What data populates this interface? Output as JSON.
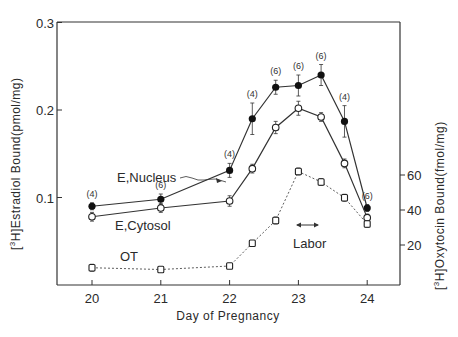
{
  "chart_data": {
    "type": "line",
    "title": "",
    "xlabel": "Day of Pregnancy",
    "ylabel": "[3H] Estradiol Bound (pmol/mg)",
    "ylabel_right": "[3H] Oxytocin Bound (fmol/mg)",
    "xlim": [
      19.5,
      24.5
    ],
    "ylim": [
      0,
      0.3
    ],
    "ylim_right": [
      0,
      80
    ],
    "x_ticks": [
      20,
      21,
      22,
      23,
      24
    ],
    "y_ticks": [
      0.1,
      0.2,
      0.3
    ],
    "y_ticks_right": [
      20,
      40,
      60
    ],
    "grid": false,
    "series": [
      {
        "name": "E, Nucleus",
        "axis": "left",
        "marker": "filled-circle",
        "line": "solid",
        "x": [
          20,
          21,
          22,
          22.33,
          22.67,
          23,
          23.33,
          23.67,
          24
        ],
        "values": [
          0.09,
          0.098,
          0.131,
          0.19,
          0.226,
          0.228,
          0.24,
          0.187,
          0.088
        ],
        "errors": [
          0.004,
          0.006,
          0.008,
          0.018,
          0.008,
          0.012,
          0.012,
          0.018,
          0.004
        ],
        "n": [
          "(4)",
          "(6)",
          "(4)",
          "(4)",
          "(6)",
          "(6)",
          "(6)",
          "(4)",
          "(6)"
        ]
      },
      {
        "name": "E, Cytosol",
        "axis": "left",
        "marker": "open-circle",
        "line": "solid",
        "x": [
          20,
          21,
          22,
          22.33,
          22.67,
          23,
          23.33,
          23.67,
          24
        ],
        "values": [
          0.078,
          0.088,
          0.096,
          0.133,
          0.18,
          0.202,
          0.192,
          0.139,
          0.077
        ],
        "errors": [
          0.005,
          0.005,
          0.006,
          0.005,
          0.007,
          0.008,
          0.005,
          0.005,
          0.004
        ]
      },
      {
        "name": "OT",
        "axis": "right",
        "marker": "open-square",
        "line": "dashed",
        "x": [
          20,
          21,
          22,
          22.33,
          22.67,
          23,
          23.33,
          23.67,
          24
        ],
        "values": [
          7,
          6,
          8,
          21,
          34,
          62,
          56,
          47,
          32
        ],
        "errors": [
          2,
          1,
          1,
          1,
          2,
          2,
          2,
          2,
          2
        ]
      }
    ],
    "annotations": [
      {
        "text": "E,Nucleus",
        "type": "series-label"
      },
      {
        "text": "E,Cytosol",
        "type": "series-label"
      },
      {
        "text": "OT",
        "type": "series-label"
      },
      {
        "text": "Labor",
        "type": "range-arrow",
        "x_range": [
          22.75,
          23.2
        ]
      }
    ]
  },
  "labels": {
    "xlabel": "Day of Pregnancy",
    "ylabel_left_iso": "3",
    "ylabel_left_main": "H]Estradiol Bound(pmol/mg)",
    "ylabel_right_iso": "3",
    "ylabel_right_main": "H]Oxytocin Bound(fmol/mg)",
    "nucleus": "E,Nucleus",
    "cytosol": "E,Cytosol",
    "ot": "OT",
    "labor": "Labor"
  },
  "ticks": {
    "x": [
      "20",
      "21",
      "22",
      "23",
      "24"
    ],
    "y_left": [
      "0.1",
      "0.2",
      "0.3"
    ],
    "y_right": [
      "20",
      "40",
      "60"
    ]
  }
}
